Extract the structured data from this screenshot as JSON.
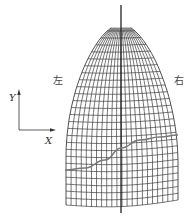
{
  "figure": {
    "type": "wireframe-mesh",
    "labels": {
      "left": "左",
      "right": "右",
      "axis_x": "X",
      "axis_y": "Y"
    },
    "colors": {
      "mesh": "#3a3a3a",
      "center_line": "#222222",
      "curve": "#7a7a7a",
      "axis": "#333333",
      "text": "#444444"
    },
    "mesh": {
      "apex": [
        121,
        24
      ],
      "bottom_y": 205,
      "left_bottom": [
        66,
        205
      ],
      "right_bottom": [
        178,
        200
      ],
      "columns": 22,
      "rows": 26
    },
    "center_line": {
      "x": 121,
      "y1": 5,
      "y2": 213
    },
    "curve_points": [
      [
        65,
        170
      ],
      [
        85,
        168
      ],
      [
        105,
        160
      ],
      [
        121,
        148
      ],
      [
        140,
        140
      ],
      [
        160,
        137
      ],
      [
        178,
        135
      ]
    ]
  }
}
